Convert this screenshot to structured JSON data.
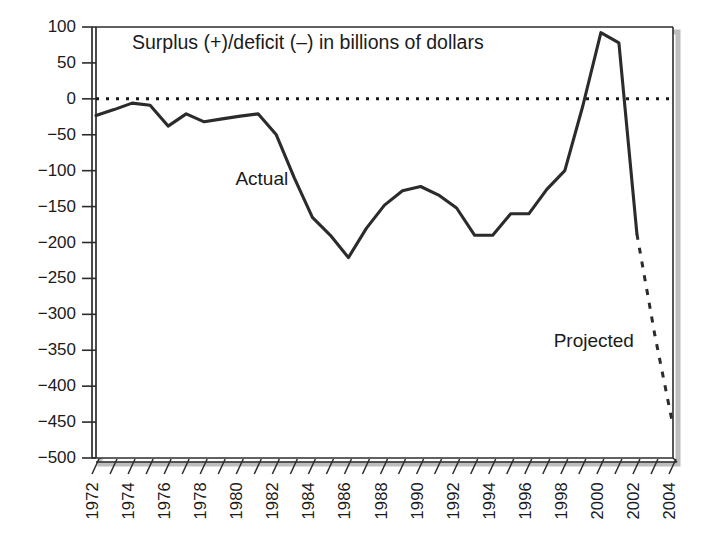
{
  "chart_data": {
    "type": "line",
    "title": "Surplus (+)/deficit (–) in billions of dollars",
    "xlabel": "",
    "ylabel": "",
    "ylim": [
      -500,
      100
    ],
    "xlim": [
      1972,
      2004
    ],
    "ytick_step": 50,
    "grid": false,
    "legend": "none",
    "zero_line": {
      "value": 0,
      "style": "dotted"
    },
    "yticks": [
      "100",
      "50",
      "0",
      "−50",
      "−100",
      "−150",
      "−200",
      "−250",
      "−300",
      "−350",
      "−400",
      "−450",
      "−500"
    ],
    "ytick_values": [
      100,
      50,
      0,
      -50,
      -100,
      -150,
      -200,
      -250,
      -300,
      -350,
      -400,
      -450,
      -500
    ],
    "xticks": [
      "1972",
      "1974",
      "1976",
      "1978",
      "1980",
      "1982",
      "1984",
      "1986",
      "1988",
      "1990",
      "1992",
      "1994",
      "1996",
      "1998",
      "2000",
      "2002",
      "2004"
    ],
    "xtick_values": [
      1972,
      1974,
      1976,
      1978,
      1980,
      1982,
      1984,
      1986,
      1988,
      1990,
      1992,
      1994,
      1996,
      1998,
      2000,
      2002,
      2004
    ],
    "minor_tick_interval": 1,
    "annotations": [
      {
        "text": "Actual",
        "x": 1981.2,
        "y": -112,
        "name": "actual-label"
      },
      {
        "text": "Projected",
        "x": 1999.6,
        "y": -337,
        "name": "projected-label"
      }
    ],
    "series": [
      {
        "name": "Actual",
        "style": "solid",
        "x": [
          1972,
          1973,
          1974,
          1975,
          1976,
          1977,
          1978,
          1979,
          1980,
          1981,
          1982,
          1983,
          1984,
          1985,
          1986,
          1987,
          1988,
          1989,
          1990,
          1991,
          1992,
          1993,
          1994,
          1995,
          1996,
          1997,
          1998,
          1999,
          2000,
          2001,
          2002
        ],
        "values": [
          -23,
          -15,
          -6,
          -9,
          -38,
          -21,
          -32,
          -28,
          -24,
          -21,
          -50,
          -110,
          -165,
          -190,
          -221,
          -180,
          -148,
          -128,
          -122,
          -134,
          -152,
          -190,
          -190,
          -160,
          -160,
          -126,
          -100,
          -10,
          92,
          78,
          -188
        ]
      },
      {
        "name": "Projected",
        "style": "dashed",
        "x": [
          2002,
          2003,
          2004
        ],
        "values": [
          -188,
          -330,
          -455
        ]
      }
    ]
  }
}
